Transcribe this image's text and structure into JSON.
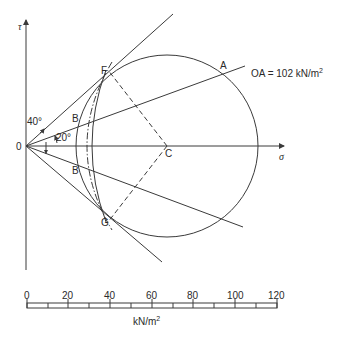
{
  "axes": {
    "x_label": "σ",
    "y_label": "τ",
    "origin_label": "0"
  },
  "points": {
    "A": "A",
    "F": "F",
    "B_upper": "B",
    "B_lower": "B",
    "C": "C",
    "G": "G"
  },
  "angles": {
    "upper": "40°",
    "lower": "20°"
  },
  "annotation": {
    "text": "OA = 102 kN/m",
    "superscript": "2"
  },
  "scale_bar": {
    "ticks": [
      "0",
      "20",
      "40",
      "60",
      "80",
      "100",
      "120"
    ],
    "unit": "kN/m",
    "unit_superscript": "2"
  },
  "colors": {
    "line": "#3a3a3a",
    "text": "#2a2a2a",
    "background": "#ffffff"
  }
}
